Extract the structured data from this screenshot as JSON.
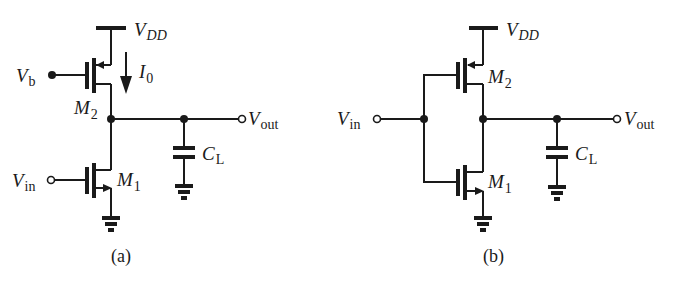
{
  "figure": {
    "circuit_a": {
      "caption": "(a)",
      "supply": {
        "main": "V",
        "sub": "DD"
      },
      "bias": {
        "main": "V",
        "sub": "b"
      },
      "current": {
        "main": "I",
        "sub": "0"
      },
      "top_transistor": {
        "main": "M",
        "sub": "2"
      },
      "bottom_transistor": {
        "main": "M",
        "sub": "1"
      },
      "input": {
        "main": "V",
        "sub": "in"
      },
      "output": {
        "main": "V",
        "sub": "out"
      },
      "load_cap": {
        "main": "C",
        "sub": "L"
      }
    },
    "circuit_b": {
      "caption": "(b)",
      "supply": {
        "main": "V",
        "sub": "DD"
      },
      "top_transistor": {
        "main": "M",
        "sub": "2"
      },
      "bottom_transistor": {
        "main": "M",
        "sub": "1"
      },
      "input": {
        "main": "V",
        "sub": "in"
      },
      "output": {
        "main": "V",
        "sub": "out"
      },
      "load_cap": {
        "main": "C",
        "sub": "L"
      }
    }
  }
}
